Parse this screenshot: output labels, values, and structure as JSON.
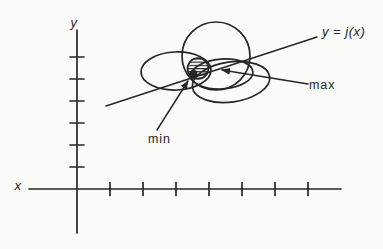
{
  "colors": {
    "background": "#fbfbf9",
    "ink": "#262626"
  },
  "labels": {
    "y_axis": {
      "text": "y",
      "x": 74,
      "y": 27
    },
    "x_axis": {
      "text": "x",
      "x": 18,
      "y": 190
    },
    "curve": {
      "text": "y = j(x)",
      "x": 322,
      "y": 36
    },
    "max": {
      "text": "max",
      "x": 309,
      "y": 89
    },
    "min": {
      "text": "min",
      "x": 148,
      "y": 143
    }
  },
  "diagram": {
    "x_axis": {
      "y": 189,
      "x1": 29,
      "x2": 341,
      "tick_half": 6.5,
      "ticks": [
        110,
        143,
        176,
        209,
        242,
        275,
        308
      ]
    },
    "y_axis": {
      "x": 77,
      "y1": 30,
      "y2": 233,
      "tick_half": 7,
      "ticks": [
        57,
        79,
        101,
        123,
        145,
        167
      ]
    },
    "curve_line": {
      "x1": 106,
      "y1": 106,
      "x2": 317,
      "y2": 37
    },
    "level_curves": [
      {
        "type": "circle",
        "cx": 216,
        "cy": 56,
        "r": 34,
        "rot": 0
      },
      {
        "type": "ellipse",
        "cx": 176,
        "cy": 71,
        "rx": 35,
        "ry": 19,
        "rot": -2
      },
      {
        "type": "ellipse",
        "cx": 222,
        "cy": 74,
        "rx": 31,
        "ry": 15,
        "rot": -4
      },
      {
        "type": "ellipse",
        "cx": 231,
        "cy": 82,
        "rx": 39,
        "ry": 20,
        "rot": -8
      }
    ],
    "hatch_region": {
      "cx": 198,
      "cy": 68.5,
      "r": 10.5
    },
    "tangency_dot": {
      "cx": 193.5,
      "cy": 73.5,
      "r": 3.8
    },
    "max_arrow": {
      "x1": 308,
      "y1": 84,
      "x2": 222,
      "y2": 70
    },
    "min_arrow": {
      "x1": 157,
      "y1": 130,
      "x2": 188,
      "y2": 81
    }
  }
}
